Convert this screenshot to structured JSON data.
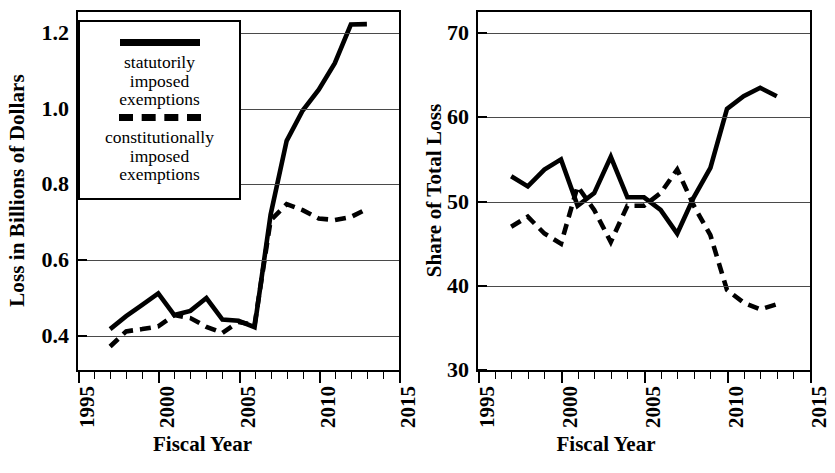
{
  "chart_data": [
    {
      "type": "line",
      "panel": "left",
      "title": "",
      "xlabel": "Fiscal Year",
      "ylabel": "Loss in Billions of Dollars",
      "xlim": [
        1995,
        2015
      ],
      "ylim": [
        0.31,
        1.255
      ],
      "xticks": [
        1995,
        1996,
        1997,
        1998,
        1999,
        2000,
        2001,
        2002,
        2003,
        2004,
        2005,
        2006,
        2007,
        2008,
        2009,
        2010,
        2011,
        2012,
        2013,
        2014,
        2015
      ],
      "xticklabels": [
        "1995",
        "2000",
        "2005",
        "2010",
        "2015"
      ],
      "xticklabel_values": [
        1995,
        2000,
        2005,
        2010,
        2015
      ],
      "yticks": [
        0.4,
        0.6,
        0.8,
        1.0,
        1.2
      ],
      "yticklabels": [
        "0.4",
        "0.6",
        "0.8",
        "1.0",
        "1.2"
      ],
      "grid": true,
      "legend_position": "upper left",
      "x": [
        1997,
        1998,
        1999,
        2000,
        2001,
        2002,
        2003,
        2004,
        2005,
        2006,
        2007,
        2008,
        2009,
        2010,
        2011,
        2012,
        2013
      ],
      "series": [
        {
          "name": "statutorily imposed exemptions",
          "style": "solid",
          "values": [
            0.418,
            0.452,
            0.482,
            0.512,
            0.455,
            0.466,
            0.5,
            0.443,
            0.44,
            0.423,
            0.72,
            0.915,
            0.995,
            1.05,
            1.12,
            1.222,
            1.223
          ]
        },
        {
          "name": "constitutionally imposed exemptions",
          "style": "dashed",
          "values": [
            0.372,
            0.412,
            0.418,
            0.425,
            0.455,
            0.447,
            0.424,
            0.408,
            0.437,
            0.429,
            0.705,
            0.748,
            0.732,
            0.71,
            0.706,
            0.714,
            0.735
          ]
        }
      ]
    },
    {
      "type": "line",
      "panel": "right",
      "title": "",
      "xlabel": "Fiscal Year",
      "ylabel": "Share of Total Loss",
      "xlim": [
        1995,
        2015
      ],
      "ylim": [
        30,
        72.5
      ],
      "xticks": [
        1995,
        1996,
        1997,
        1998,
        1999,
        2000,
        2001,
        2002,
        2003,
        2004,
        2005,
        2006,
        2007,
        2008,
        2009,
        2010,
        2011,
        2012,
        2013,
        2014,
        2015
      ],
      "xticklabels": [
        "1995",
        "2000",
        "2005",
        "2010",
        "2015"
      ],
      "xticklabel_values": [
        1995,
        2000,
        2005,
        2010,
        2015
      ],
      "yticks": [
        30,
        40,
        50,
        60,
        70
      ],
      "yticklabels": [
        "30",
        "40",
        "50",
        "60",
        "70"
      ],
      "grid": true,
      "legend_position": "none",
      "x": [
        1997,
        1998,
        1999,
        2000,
        2001,
        2002,
        2003,
        2004,
        2005,
        2006,
        2007,
        2008,
        2009,
        2010,
        2011,
        2012,
        2013
      ],
      "series": [
        {
          "name": "statutorily imposed exemptions",
          "style": "solid",
          "values": [
            53.0,
            51.8,
            53.8,
            55.0,
            49.5,
            51.0,
            55.3,
            50.5,
            50.5,
            49.0,
            46.2,
            50.5,
            54.0,
            61.0,
            62.5,
            63.5,
            62.5
          ]
        },
        {
          "name": "constitutionally imposed exemptions",
          "style": "dashed",
          "values": [
            47.0,
            48.2,
            46.2,
            45.0,
            51.8,
            49.0,
            45.2,
            49.5,
            49.5,
            51.0,
            53.8,
            49.5,
            46.0,
            39.5,
            38.0,
            37.2,
            37.8
          ]
        }
      ]
    }
  ],
  "legend": {
    "entries": [
      {
        "swatch": "solid-line-swatch",
        "label_line1": "statutorily",
        "label_line2": "imposed",
        "label_line3": "exemptions"
      },
      {
        "swatch": "dashed-line-swatch",
        "label_line1": "constitutionally",
        "label_line2": "imposed",
        "label_line3": "exemptions"
      }
    ]
  },
  "colors": {
    "line": "#000000",
    "grid": "#4a4a4a",
    "axis": "#000000",
    "background": "#ffffff"
  }
}
